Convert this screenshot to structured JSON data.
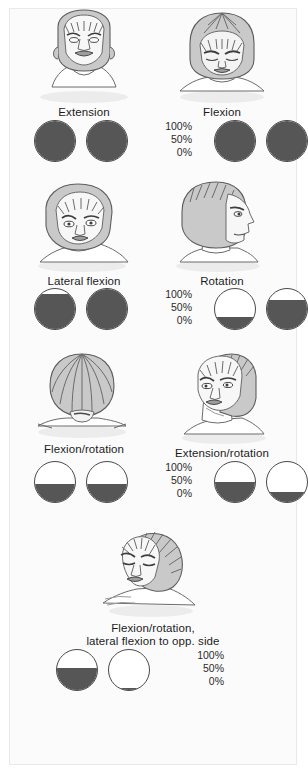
{
  "figure": {
    "background_color": "#fbfbfb",
    "fill_color": "#565656",
    "outline_color": "#4a4a4a",
    "scale_labels": [
      "100%",
      "50%",
      "0%"
    ],
    "rows": [
      {
        "row_id": "row-1",
        "items": [
          {
            "label": "Extension",
            "icon": "head-extension-front-icon",
            "gauges": [
              {
                "name": "gauge-left",
                "percent": 100
              },
              {
                "name": "gauge-right",
                "percent": 100
              }
            ]
          },
          {
            "label": "Flexion",
            "icon": "head-flexion-top-icon",
            "gauges": [
              {
                "name": "gauge-left",
                "percent": 100
              },
              {
                "name": "gauge-right",
                "percent": 100
              }
            ]
          }
        ]
      },
      {
        "row_id": "row-2",
        "items": [
          {
            "label": "Lateral flexion",
            "icon": "head-lateral-flexion-icon",
            "gauges": [
              {
                "name": "gauge-left",
                "percent": 88
              },
              {
                "name": "gauge-right",
                "percent": 100
              }
            ]
          },
          {
            "label": "Rotation",
            "icon": "head-rotation-profile-icon",
            "gauges": [
              {
                "name": "gauge-left",
                "percent": 30
              },
              {
                "name": "gauge-right",
                "percent": 72
              }
            ]
          }
        ]
      },
      {
        "row_id": "row-3",
        "items": [
          {
            "label": "Flexion/rotation",
            "icon": "head-flexion-rotation-crown-icon",
            "gauges": [
              {
                "name": "gauge-left",
                "percent": 45
              },
              {
                "name": "gauge-right",
                "percent": 45
              }
            ]
          },
          {
            "label": "Extension/rotation",
            "icon": "head-extension-rotation-icon",
            "gauges": [
              {
                "name": "gauge-left",
                "percent": 50
              },
              {
                "name": "gauge-right",
                "percent": 25
              }
            ]
          }
        ]
      },
      {
        "row_id": "row-4",
        "items": [
          {
            "label": "Flexion/rotation,\nlateral flexion to opp. side",
            "icon": "head-flexion-rotation-lateral-icon",
            "gauges": [
              {
                "name": "gauge-left",
                "percent": 55
              },
              {
                "name": "gauge-right",
                "percent": 5
              }
            ]
          }
        ]
      }
    ]
  }
}
